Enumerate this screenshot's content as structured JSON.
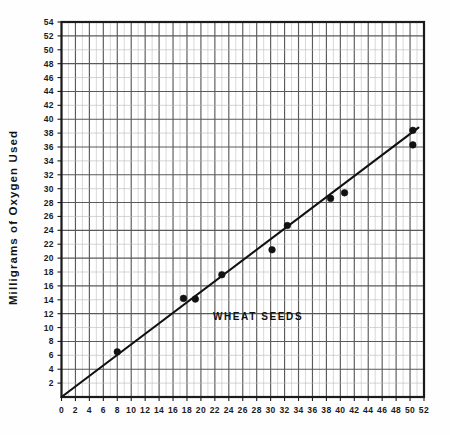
{
  "chart_data": {
    "type": "scatter",
    "title": "",
    "xlabel": "",
    "ylabel": "Milligrams  of  Oxygen  Used",
    "xlim": [
      0,
      52
    ],
    "ylim": [
      0,
      54
    ],
    "xticks": [
      0,
      2,
      4,
      6,
      8,
      10,
      12,
      14,
      16,
      18,
      20,
      22,
      24,
      26,
      28,
      30,
      32,
      34,
      36,
      38,
      40,
      42,
      44,
      46,
      48,
      50,
      52
    ],
    "yticks": [
      2,
      4,
      6,
      8,
      10,
      12,
      14,
      16,
      18,
      20,
      22,
      24,
      26,
      28,
      30,
      32,
      34,
      36,
      38,
      40,
      42,
      44,
      46,
      48,
      50,
      52,
      54
    ],
    "grid": true,
    "grid_x_minor_step": 1,
    "grid_x_major_step": 2,
    "grid_y_minor_step": 2,
    "grid_y_major_step": 4,
    "legend": "none",
    "annotations": [
      {
        "text": "WHEAT  SEEDS",
        "x": 28.2,
        "y": 11.6
      }
    ],
    "series": [
      {
        "name": "Wheat seeds oxygen uptake",
        "marker": "filled-circle",
        "color": "#111111",
        "points": [
          {
            "x": 8.0,
            "y": 6.5
          },
          {
            "x": 17.5,
            "y": 14.2
          },
          {
            "x": 19.2,
            "y": 14.1
          },
          {
            "x": 23.0,
            "y": 17.6
          },
          {
            "x": 30.2,
            "y": 21.2
          },
          {
            "x": 32.4,
            "y": 24.7
          },
          {
            "x": 38.6,
            "y": 28.6
          },
          {
            "x": 40.6,
            "y": 29.4
          },
          {
            "x": 50.4,
            "y": 38.4
          },
          {
            "x": 50.4,
            "y": 36.3
          }
        ]
      }
    ],
    "fit_line": {
      "name": "best-fit line",
      "from": {
        "x": 0.0,
        "y": 0.0
      },
      "to": {
        "x": 51.2,
        "y": 38.8
      },
      "color": "#111111"
    }
  },
  "axes": {
    "frame_color": "#1b1b1b",
    "grid_minor_color": "#b9b9b9",
    "grid_major_color": "#5a5a5a"
  }
}
